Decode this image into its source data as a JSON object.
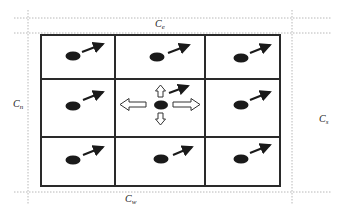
{
  "diagram": {
    "type": "3x3 grid with boundary regions",
    "colors": {
      "grid_line": "#2a2a2a",
      "dotted_line": "#b8b8b8",
      "particle": "#1a1a1a",
      "arrow_solid": "#1a1a1a",
      "arrow_hollow_stroke": "#333333"
    },
    "boundary_labels": {
      "top": {
        "base": "C",
        "sub": "e"
      },
      "left": {
        "base": "C",
        "sub": "n"
      },
      "right": {
        "base": "C",
        "sub": "s"
      },
      "bottom": {
        "base": "C",
        "sub": "w"
      }
    },
    "grid": {
      "rows": 3,
      "cols": 3,
      "cells": [
        {
          "row": 0,
          "col": 0,
          "particle": true,
          "velocity_arrow": "up-right"
        },
        {
          "row": 0,
          "col": 1,
          "particle": true,
          "velocity_arrow": "up-right"
        },
        {
          "row": 0,
          "col": 2,
          "particle": true,
          "velocity_arrow": "up-right"
        },
        {
          "row": 1,
          "col": 0,
          "particle": true,
          "velocity_arrow": "up-right"
        },
        {
          "row": 1,
          "col": 1,
          "particle": true,
          "velocity_arrow": "up-right",
          "neighbor_arrows": [
            "up",
            "down",
            "left",
            "right"
          ]
        },
        {
          "row": 1,
          "col": 2,
          "particle": true,
          "velocity_arrow": "up-right"
        },
        {
          "row": 2,
          "col": 0,
          "particle": true,
          "velocity_arrow": "up-right"
        },
        {
          "row": 2,
          "col": 1,
          "particle": true,
          "velocity_arrow": "up-right"
        },
        {
          "row": 2,
          "col": 2,
          "particle": true,
          "velocity_arrow": "up-right"
        }
      ]
    }
  }
}
